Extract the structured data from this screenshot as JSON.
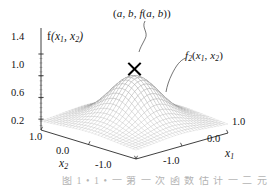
{
  "figure": {
    "background_color": "#ffffff",
    "mesh_color": "#8a8a8a",
    "axis_color": "#2a2a2a",
    "marker_color": "#000000",
    "width": 269,
    "height": 188
  },
  "annotations": {
    "peak": "(a, b, f(a, b))",
    "surface": "f2(x1, x2)",
    "marker": "x-marker"
  },
  "caption": {
    "text": "图 1 • 1 • 一 第 一 次 函 数 估 计 一 二 元 斯 函 数"
  },
  "chart_data": {
    "type": "surface",
    "title": "",
    "xlabel": "x1",
    "ylabel": "x2",
    "zlabel": "f(x1, x2)",
    "grid": true,
    "legend": "none",
    "projection": "3d-wireframe",
    "xlim": [
      -1.0,
      1.0
    ],
    "ylim": [
      -1.0,
      1.0
    ],
    "zlim": [
      0.0,
      1.4
    ],
    "x_ticks": [
      -1.0,
      0.0,
      1.0
    ],
    "x_tick_labels": [
      "-1.0",
      "0.0",
      "1.0"
    ],
    "y_ticks": [
      1.0,
      0.0,
      -1.0
    ],
    "y_tick_labels": [
      "1.0",
      "0.0",
      "-1.0"
    ],
    "z_ticks": [
      0.2,
      0.6,
      1.0,
      1.4
    ],
    "z_tick_labels": [
      "0.2",
      "0.6",
      "1.0",
      "1.4"
    ],
    "z_minor_tick_count": 3,
    "surface_function": "gaussian-bump",
    "peak_value": 1.15,
    "peak_x": 0.0,
    "peak_y": 0.0,
    "base_value": 0.12,
    "mesh_rows": 30,
    "mesh_cols": 30,
    "marker_point": {
      "x": 0.0,
      "y": 0.0,
      "z": 1.15,
      "symbol": "X"
    },
    "view": {
      "azimuth": -55,
      "elevation": 24
    }
  },
  "axes": {
    "z": {
      "label": "f(x1, x2)",
      "label_base": "f",
      "label_args_1": "x",
      "label_sub_1": "1",
      "label_args_2": "x",
      "label_sub_2": "2",
      "ticks": [
        "1.4",
        "1.0",
        "0.6",
        "0.2"
      ]
    },
    "x2": {
      "label_base": "x",
      "label_sub": "2",
      "ticks": [
        "1.0",
        "0.0",
        "-1.0"
      ]
    },
    "x1": {
      "label_base": "x",
      "label_sub": "1",
      "ticks": [
        "1.0",
        "0.0",
        "-1.0"
      ]
    }
  },
  "labels": {
    "peak_prefix": "(",
    "peak_a": "a",
    "peak_comma1": ", ",
    "peak_b": "b",
    "peak_comma2": ", ",
    "peak_f": "f",
    "peak_open": "(",
    "peak_a2": "a",
    "peak_comma3": ", ",
    "peak_b2": "b",
    "peak_close": "))",
    "f2_base": "f",
    "f2_sub": "2",
    "f2_open": "(",
    "f2_x1": "x",
    "f2_x1sub": "1",
    "f2_comma": ", ",
    "f2_x2": "x",
    "f2_x2sub": "2",
    "f2_close": ")"
  }
}
